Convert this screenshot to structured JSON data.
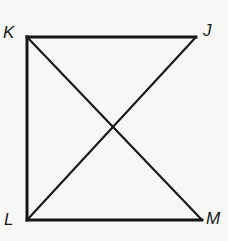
{
  "diagram": {
    "type": "geometry-figure",
    "colors": {
      "background": "#f7f7f5",
      "stroke": "#161616",
      "label": "#1a1a1a"
    },
    "vertices": [
      {
        "id": "K",
        "label": "K",
        "x": 27,
        "y": 37,
        "label_x": 3,
        "label_y": 38
      },
      {
        "id": "J",
        "label": "J",
        "x": 196,
        "y": 37,
        "label_x": 203,
        "label_y": 36
      },
      {
        "id": "L",
        "label": "L",
        "x": 27,
        "y": 220,
        "label_x": 4,
        "label_y": 225
      },
      {
        "id": "M",
        "label": "M",
        "x": 202,
        "y": 220,
        "label_x": 206,
        "label_y": 224
      }
    ],
    "edges": [
      {
        "from": "K",
        "to": "J"
      },
      {
        "from": "K",
        "to": "L"
      },
      {
        "from": "L",
        "to": "M"
      }
    ],
    "diagonals": [
      {
        "from": "K",
        "to": "M"
      },
      {
        "from": "J",
        "to": "L"
      }
    ],
    "intersection": {
      "x": 115,
      "y": 129
    }
  }
}
